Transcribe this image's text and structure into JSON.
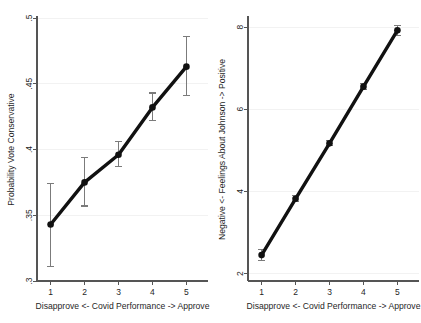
{
  "figure": {
    "background": "#ffffff",
    "line_color": "#111111",
    "error_bar_color": "#7b7b7b",
    "grid_color": "#f2f2f2",
    "axis_color": "#555555"
  },
  "chart_data": [
    {
      "type": "line",
      "panel": "left",
      "title": "",
      "xlabel": "Disapprove <- Covid  Performance -> Approve",
      "ylabel": "Probability Vote Conservative",
      "x": [
        1,
        2,
        3,
        4,
        5
      ],
      "xticklabels": [
        "1",
        "2",
        "3",
        "4",
        "5"
      ],
      "values": [
        0.343,
        0.375,
        0.396,
        0.432,
        0.463
      ],
      "ci_low": [
        0.311,
        0.357,
        0.387,
        0.422,
        0.441
      ],
      "ci_high": [
        0.374,
        0.394,
        0.406,
        0.443,
        0.486
      ],
      "yticks": [
        0.3,
        0.35,
        0.4,
        0.45,
        0.5
      ],
      "yticklabels": [
        ".3",
        ".35",
        ".4",
        ".45",
        ".5"
      ],
      "ylim": [
        0.3,
        0.5
      ],
      "xlim": [
        0.6,
        5.4
      ],
      "grid": true,
      "legend": "none",
      "marker": "circle"
    },
    {
      "type": "line",
      "panel": "right",
      "title": "",
      "xlabel": "Disapprove <- Covid  Performance -> Approve",
      "ylabel": "Negative <- Feelings About Johnson -> Positive",
      "x": [
        1,
        2,
        3,
        4,
        5
      ],
      "xticklabels": [
        "1",
        "2",
        "3",
        "4",
        "5"
      ],
      "values": [
        2.45,
        3.82,
        5.17,
        6.55,
        7.92
      ],
      "ci_low": [
        2.32,
        3.75,
        5.12,
        6.48,
        7.8
      ],
      "ci_high": [
        2.58,
        3.9,
        5.23,
        6.62,
        8.04
      ],
      "yticks": [
        2,
        4,
        6,
        8
      ],
      "yticklabels": [
        "2",
        "4",
        "6",
        "8"
      ],
      "ylim": [
        1.82,
        8.22
      ],
      "xlim": [
        0.6,
        5.4
      ],
      "grid": true,
      "legend": "none",
      "marker": "circle"
    }
  ]
}
